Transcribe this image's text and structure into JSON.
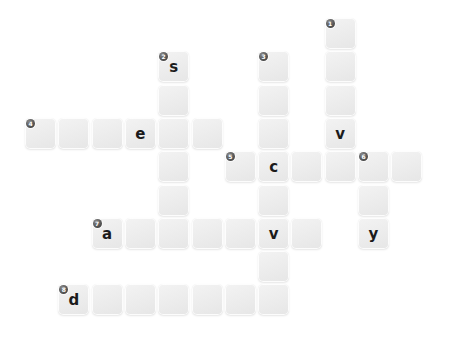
{
  "puzzle": {
    "title": "crossword-grid",
    "background_color": "#ffffff",
    "cell_color": "#ededed",
    "letter_color": "#1b1b1b",
    "clue_badge_color": "#4a4a4a",
    "geometry": {
      "origin_x": 25,
      "origin_y": 18,
      "cell_size": 31,
      "pitch": 33.3
    },
    "cells": [
      {
        "col": 9,
        "row": 0,
        "clue": "1",
        "letter": ""
      },
      {
        "col": 9,
        "row": 1,
        "clue": "",
        "letter": ""
      },
      {
        "col": 9,
        "row": 2,
        "clue": "",
        "letter": ""
      },
      {
        "col": 9,
        "row": 3,
        "clue": "",
        "letter": "v"
      },
      {
        "col": 9,
        "row": 4,
        "clue": "",
        "letter": ""
      },
      {
        "col": 4,
        "row": 1,
        "clue": "2",
        "letter": "s"
      },
      {
        "col": 4,
        "row": 2,
        "clue": "",
        "letter": ""
      },
      {
        "col": 4,
        "row": 3,
        "clue": "",
        "letter": ""
      },
      {
        "col": 4,
        "row": 4,
        "clue": "",
        "letter": ""
      },
      {
        "col": 4,
        "row": 5,
        "clue": "",
        "letter": ""
      },
      {
        "col": 4,
        "row": 6,
        "clue": "",
        "letter": ""
      },
      {
        "col": 7,
        "row": 1,
        "clue": "3",
        "letter": ""
      },
      {
        "col": 7,
        "row": 2,
        "clue": "",
        "letter": ""
      },
      {
        "col": 7,
        "row": 3,
        "clue": "",
        "letter": ""
      },
      {
        "col": 7,
        "row": 4,
        "clue": "",
        "letter": "c"
      },
      {
        "col": 7,
        "row": 5,
        "clue": "",
        "letter": ""
      },
      {
        "col": 7,
        "row": 6,
        "clue": "",
        "letter": "v"
      },
      {
        "col": 7,
        "row": 7,
        "clue": "",
        "letter": ""
      },
      {
        "col": 7,
        "row": 8,
        "clue": "",
        "letter": ""
      },
      {
        "col": 0,
        "row": 3,
        "clue": "4",
        "letter": ""
      },
      {
        "col": 1,
        "row": 3,
        "clue": "",
        "letter": ""
      },
      {
        "col": 2,
        "row": 3,
        "clue": "",
        "letter": ""
      },
      {
        "col": 3,
        "row": 3,
        "clue": "",
        "letter": "e"
      },
      {
        "col": 5,
        "row": 3,
        "clue": "",
        "letter": ""
      },
      {
        "col": 6,
        "row": 4,
        "clue": "5",
        "letter": ""
      },
      {
        "col": 8,
        "row": 4,
        "clue": "",
        "letter": ""
      },
      {
        "col": 10,
        "row": 4,
        "clue": "6",
        "letter": ""
      },
      {
        "col": 11,
        "row": 4,
        "clue": "",
        "letter": ""
      },
      {
        "col": 10,
        "row": 5,
        "clue": "",
        "letter": ""
      },
      {
        "col": 10,
        "row": 6,
        "clue": "",
        "letter": "y"
      },
      {
        "col": 2,
        "row": 6,
        "clue": "7",
        "letter": "a"
      },
      {
        "col": 3,
        "row": 6,
        "clue": "",
        "letter": ""
      },
      {
        "col": 5,
        "row": 6,
        "clue": "",
        "letter": ""
      },
      {
        "col": 6,
        "row": 6,
        "clue": "",
        "letter": ""
      },
      {
        "col": 8,
        "row": 6,
        "clue": "",
        "letter": ""
      },
      {
        "col": 1,
        "row": 8,
        "clue": "8",
        "letter": "d"
      },
      {
        "col": 2,
        "row": 8,
        "clue": "",
        "letter": ""
      },
      {
        "col": 3,
        "row": 8,
        "clue": "",
        "letter": ""
      },
      {
        "col": 4,
        "row": 8,
        "clue": "",
        "letter": ""
      },
      {
        "col": 5,
        "row": 8,
        "clue": "",
        "letter": ""
      },
      {
        "col": 6,
        "row": 8,
        "clue": "",
        "letter": ""
      }
    ]
  }
}
